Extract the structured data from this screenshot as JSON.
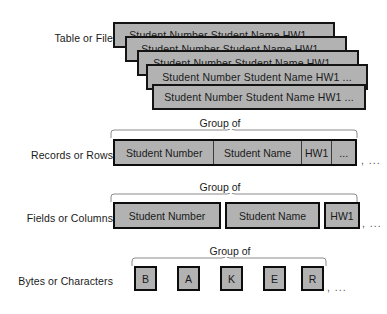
{
  "diagram": {
    "group_caption": "Group of",
    "trailing_ellipsis": ", ...",
    "inline_ellipsis": "...",
    "colors": {
      "box_fill": "#b2b2b2",
      "box_border": "#0d0d0d",
      "brace_stroke": "#8a8a8a",
      "text": "#1a1a1a",
      "background": "#ffffff"
    },
    "levels": {
      "table": {
        "label": "Table or File",
        "card_text": "Student Number  Student Name  HW1  ...",
        "card_count": 5
      },
      "records": {
        "label": "Records or Rows",
        "caption": "Group of",
        "cells": [
          "Student Number",
          "Student Name",
          "HW1",
          "..."
        ],
        "tail": ", ..."
      },
      "fields": {
        "label": "Fields or Columns",
        "caption": "Group of",
        "boxes": [
          "Student Number",
          "Student Name",
          "HW1"
        ],
        "tail": ", ..."
      },
      "bytes": {
        "label": "Bytes or Characters",
        "caption": "Group of",
        "characters": [
          "B",
          "A",
          "K",
          "E",
          "R"
        ],
        "tail": ", ..."
      }
    }
  }
}
